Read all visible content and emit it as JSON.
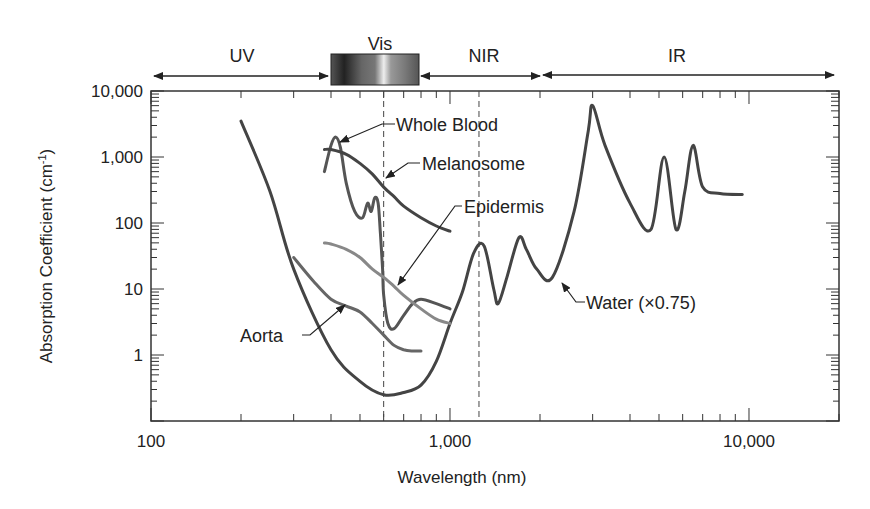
{
  "chart_data": {
    "type": "line",
    "title": "",
    "xlabel": "Wavelength (nm)",
    "ylabel": "Absorption Coefficient (cm-1)",
    "ylabel_parts": {
      "main": "Absorption Coefficient (cm",
      "sup": "-1",
      "close": ")"
    },
    "xscale": "log",
    "yscale": "log",
    "xlim": [
      100,
      20000
    ],
    "ylim": [
      0.1,
      10000
    ],
    "x_ticks": [
      {
        "value": 100,
        "label": "100"
      },
      {
        "value": 1000,
        "label": "1,000"
      },
      {
        "value": 10000,
        "label": "10,000"
      }
    ],
    "y_ticks": [
      {
        "value": 10000,
        "label": "10,000"
      },
      {
        "value": 1000,
        "label": "1,000"
      },
      {
        "value": 100,
        "label": "100"
      },
      {
        "value": 10,
        "label": "10"
      },
      {
        "value": 1,
        "label": "1"
      }
    ],
    "grid": false,
    "reference_lines": [
      {
        "x": 600,
        "style": "dashed"
      },
      {
        "x": 1250,
        "style": "dashed"
      }
    ],
    "spectral_bands": [
      {
        "label": "UV",
        "from": 100,
        "to": 400
      },
      {
        "label": "Vis",
        "from": 400,
        "to": 700,
        "gradient_bar": true
      },
      {
        "label": "NIR",
        "from": 700,
        "to": 2000
      },
      {
        "label": "IR",
        "from": 2000,
        "to": 20000
      }
    ],
    "series": [
      {
        "name": "Water (×0.75)",
        "color": "#444444",
        "x": [
          200,
          250,
          300,
          400,
          500,
          600,
          700,
          800,
          900,
          1000,
          1100,
          1200,
          1300,
          1400,
          1450,
          1550,
          1700,
          1800,
          1950,
          2200,
          2600,
          2900,
          3000,
          3300,
          4000,
          4700,
          5200,
          5700,
          6100,
          6500,
          7000,
          8000,
          9500
        ],
        "values": [
          3500,
          300,
          20,
          1.2,
          0.4,
          0.25,
          0.27,
          0.35,
          0.8,
          3,
          9,
          35,
          45,
          10,
          6,
          15,
          60,
          40,
          20,
          15,
          150,
          2500,
          6000,
          1500,
          200,
          80,
          1000,
          80,
          300,
          1500,
          350,
          280,
          270
        ]
      },
      {
        "name": "Whole Blood",
        "color": "#555555",
        "x": [
          380,
          400,
          415,
          430,
          450,
          480,
          510,
          530,
          545,
          560,
          575,
          585,
          595,
          600,
          620,
          650,
          700,
          750,
          800,
          900,
          1000
        ],
        "values": [
          600,
          1500,
          2000,
          1400,
          400,
          150,
          120,
          200,
          150,
          240,
          200,
          70,
          20,
          8,
          3,
          2.5,
          4,
          6,
          7,
          6,
          5
        ]
      },
      {
        "name": "Melanosome",
        "color": "#444444",
        "x": [
          380,
          400,
          450,
          500,
          550,
          600,
          650,
          700,
          800,
          900,
          1000
        ],
        "values": [
          1300,
          1300,
          1100,
          800,
          550,
          350,
          250,
          180,
          120,
          90,
          75
        ]
      },
      {
        "name": "Epidermis",
        "color": "#888888",
        "x": [
          380,
          400,
          450,
          500,
          550,
          600,
          650,
          700,
          800,
          900,
          1000
        ],
        "values": [
          50,
          48,
          40,
          30,
          20,
          15,
          11,
          8,
          5,
          3.5,
          3
        ]
      },
      {
        "name": "Aorta",
        "color": "#666666",
        "x": [
          300,
          350,
          400,
          450,
          500,
          550,
          600,
          650,
          700,
          750,
          800
        ],
        "values": [
          30,
          13,
          7,
          5.5,
          4.5,
          3,
          2,
          1.4,
          1.2,
          1.15,
          1.15
        ]
      }
    ],
    "annotations": [
      {
        "text": "Whole Blood",
        "target_series": "Whole Blood"
      },
      {
        "text": "Melanosome",
        "target_series": "Melanosome"
      },
      {
        "text": "Epidermis",
        "target_series": "Epidermis"
      },
      {
        "text": "Aorta",
        "target_series": "Aorta"
      },
      {
        "text": "Water (×0.75)",
        "target_series": "Water (×0.75)"
      }
    ]
  }
}
